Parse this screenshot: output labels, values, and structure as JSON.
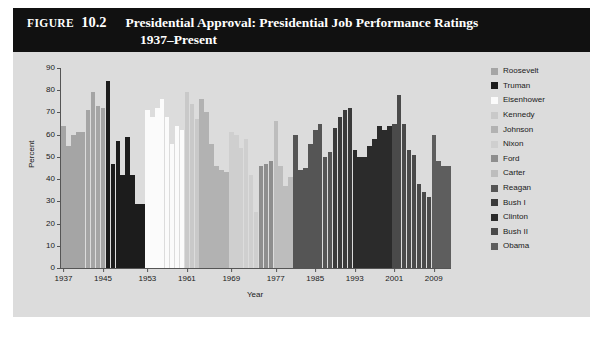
{
  "figure": {
    "label": "FIGURE",
    "number": "10.2",
    "title_line1": "Presidential Approval: Presidential Job Performance Ratings",
    "title_line2": "1937–Present"
  },
  "legend": {
    "position": "right",
    "items": [
      {
        "label": "Roosevelt",
        "color": "#a5a5a5"
      },
      {
        "label": "Truman",
        "color": "#1c1c1c"
      },
      {
        "label": "Eisenhower",
        "color": "#fbfbfb"
      },
      {
        "label": "Kennedy",
        "color": "#c9c9c9"
      },
      {
        "label": "Johnson",
        "color": "#b2b2b2"
      },
      {
        "label": "Nixon",
        "color": "#cfcfcf"
      },
      {
        "label": "Ford",
        "color": "#8e8e8e"
      },
      {
        "label": "Carter",
        "color": "#bdbdbd"
      },
      {
        "label": "Reagan",
        "color": "#555555"
      },
      {
        "label": "Bush I",
        "color": "#3a3a3a"
      },
      {
        "label": "Clinton",
        "color": "#2b2b2b"
      },
      {
        "label": "Bush II",
        "color": "#4a4a4a"
      },
      {
        "label": "Obama",
        "color": "#5e5e5e"
      }
    ]
  },
  "chart_data": {
    "type": "bar",
    "title": "Presidential Approval: Presidential Job Performance Ratings 1937–Present",
    "xlabel": "Year",
    "ylabel": "Percent",
    "ylim": [
      0,
      90
    ],
    "yticks": [
      0,
      10,
      20,
      30,
      40,
      50,
      60,
      70,
      80,
      90
    ],
    "xticks": [
      1937,
      1945,
      1953,
      1961,
      1969,
      1977,
      1985,
      1993,
      2001,
      2009
    ],
    "xlim": [
      1937,
      2013
    ],
    "grid": false,
    "series": [
      {
        "name": "Roosevelt",
        "color": "#a5a5a5",
        "years": [
          1937,
          1938,
          1939,
          1940,
          1941,
          1942,
          1943,
          1944,
          1945
        ],
        "values": [
          64,
          55,
          60,
          61,
          61,
          71,
          79,
          73,
          72
        ]
      },
      {
        "name": "Truman",
        "color": "#1c1c1c",
        "years": [
          1945,
          1946,
          1947,
          1948,
          1949,
          1950,
          1951,
          1952
        ],
        "values": [
          84,
          47,
          57,
          42,
          59,
          42,
          29,
          29
        ]
      },
      {
        "name": "Eisenhower",
        "color": "#fbfbfb",
        "years": [
          1953,
          1954,
          1955,
          1956,
          1957,
          1958,
          1959,
          1960
        ],
        "values": [
          71,
          68,
          72,
          76,
          68,
          56,
          64,
          62
        ]
      },
      {
        "name": "Kennedy",
        "color": "#c9c9c9",
        "years": [
          1961,
          1962,
          1963
        ],
        "values": [
          79,
          74,
          67
        ]
      },
      {
        "name": "Johnson",
        "color": "#b2b2b2",
        "years": [
          1963,
          1964,
          1965,
          1966,
          1967,
          1968
        ],
        "values": [
          76,
          70,
          56,
          46,
          44,
          43
        ]
      },
      {
        "name": "Nixon",
        "color": "#cfcfcf",
        "years": [
          1969,
          1970,
          1971,
          1972,
          1973,
          1974
        ],
        "values": [
          61,
          60,
          54,
          58,
          42,
          25
        ]
      },
      {
        "name": "Ford",
        "color": "#8e8e8e",
        "years": [
          1974,
          1975,
          1976
        ],
        "values": [
          46,
          47,
          48
        ]
      },
      {
        "name": "Carter",
        "color": "#bdbdbd",
        "years": [
          1977,
          1978,
          1979,
          1980
        ],
        "values": [
          66,
          46,
          37,
          41
        ]
      },
      {
        "name": "Reagan",
        "color": "#555555",
        "years": [
          1981,
          1982,
          1983,
          1984,
          1985,
          1986,
          1987,
          1988
        ],
        "values": [
          60,
          44,
          45,
          56,
          62,
          65,
          50,
          52
        ]
      },
      {
        "name": "Bush I",
        "color": "#3a3a3a",
        "years": [
          1989,
          1990,
          1991,
          1992
        ],
        "values": [
          63,
          68,
          71,
          72
        ]
      },
      {
        "name": "Clinton",
        "color": "#2b2b2b",
        "years": [
          1993,
          1994,
          1995,
          1996,
          1997,
          1998,
          1999,
          2000
        ],
        "values": [
          53,
          50,
          50,
          55,
          58,
          64,
          62,
          64
        ]
      },
      {
        "name": "Bush II",
        "color": "#4a4a4a",
        "years": [
          2001,
          2002,
          2003,
          2004,
          2005,
          2006,
          2007,
          2008
        ],
        "values": [
          65,
          78,
          65,
          53,
          51,
          38,
          34,
          32
        ]
      },
      {
        "name": "Obama",
        "color": "#5e5e5e",
        "years": [
          2009,
          2010,
          2011,
          2012
        ],
        "values": [
          60,
          48,
          46,
          46
        ]
      }
    ]
  }
}
